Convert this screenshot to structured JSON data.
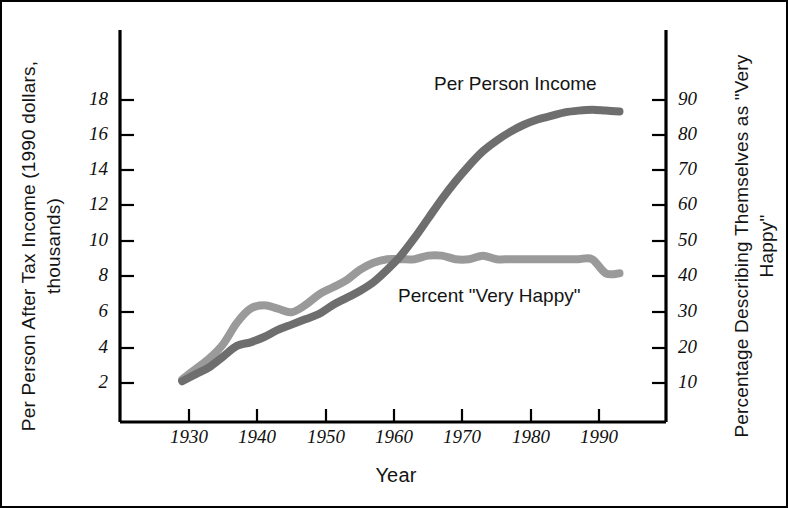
{
  "figure": {
    "background": "#ffffff",
    "frame_color": "#000000",
    "axis_color": "#000000"
  },
  "chart_data": {
    "type": "line",
    "title": "",
    "xlabel": "Year",
    "ylabel": "Per Person After Tax Income (1990 dollars, thousands)",
    "ylabel_right": "Percentage Describing Themselves as \"Very Happy\"",
    "xlim": [
      1925,
      1995
    ],
    "xticks": [
      1930,
      1940,
      1950,
      1960,
      1970,
      1980,
      1990
    ],
    "xticklabels": [
      "1930",
      "1940",
      "1950",
      "1960",
      "1970",
      "1980",
      "1990"
    ],
    "ylim": [
      0,
      20
    ],
    "yticks": [
      2,
      4,
      6,
      8,
      10,
      12,
      14,
      16,
      18
    ],
    "yticklabels": [
      "2",
      "4",
      "6",
      "8",
      "10",
      "12",
      "14",
      "16",
      "18"
    ],
    "ylim_right": [
      0,
      100
    ],
    "yticks_right": [
      10,
      20,
      30,
      40,
      50,
      60,
      70,
      80,
      90
    ],
    "yticklabels_right": [
      "10",
      "20",
      "30",
      "40",
      "50",
      "60",
      "70",
      "80",
      "90"
    ],
    "grid": false,
    "legend_position": "inline-annotations",
    "series": [
      {
        "name": "Per Person Income",
        "label_text": "Per Person Income",
        "color": "#6e6e6e",
        "axis": "left",
        "units": "1990 dollars, thousands",
        "x": [
          1929,
          1931,
          1933,
          1935,
          1937,
          1939,
          1941,
          1943,
          1945,
          1947,
          1949,
          1951,
          1953,
          1955,
          1957,
          1959,
          1961,
          1963,
          1965,
          1967,
          1969,
          1971,
          1973,
          1975,
          1977,
          1979,
          1981,
          1983,
          1985,
          1987,
          1989,
          1991,
          1993
        ],
        "y": [
          2.1,
          2.5,
          2.9,
          3.5,
          4.1,
          4.3,
          4.6,
          5.0,
          5.3,
          5.6,
          5.9,
          6.4,
          6.8,
          7.2,
          7.7,
          8.4,
          9.2,
          10.2,
          11.3,
          12.4,
          13.4,
          14.3,
          15.1,
          15.7,
          16.2,
          16.6,
          16.9,
          17.1,
          17.3,
          17.4,
          17.45,
          17.4,
          17.35
        ]
      },
      {
        "name": "Percent \"Very Happy\"",
        "label_text": "Percent \"Very Happy\"",
        "color": "#9a9a9a",
        "axis": "right",
        "units": "percent",
        "x": [
          1929,
          1931,
          1933,
          1935,
          1937,
          1939,
          1941,
          1943,
          1945,
          1947,
          1949,
          1951,
          1953,
          1955,
          1957,
          1959,
          1961,
          1963,
          1965,
          1967,
          1969,
          1971,
          1973,
          1975,
          1977,
          1979,
          1981,
          1983,
          1985,
          1987,
          1989,
          1991,
          1993
        ],
        "y": [
          11,
          14,
          17,
          21,
          27,
          31,
          32,
          31,
          30,
          32,
          35,
          37,
          39,
          42,
          44,
          45,
          45,
          45,
          46,
          46,
          45,
          45,
          46,
          45,
          45,
          45,
          45,
          45,
          45,
          45,
          45,
          41,
          41
        ]
      }
    ]
  },
  "annotations": {
    "income_label": "Per Person Income",
    "happy_label": "Percent \"Very Happy\""
  }
}
